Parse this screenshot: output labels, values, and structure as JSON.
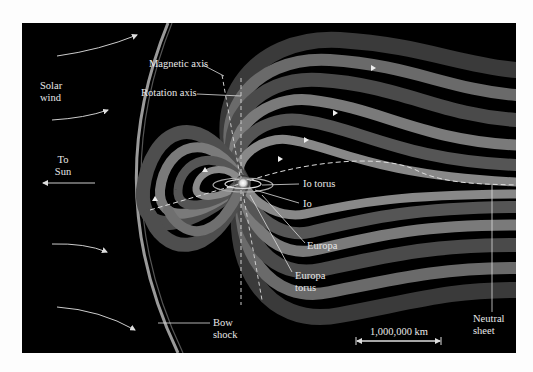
{
  "diagram": {
    "labels": {
      "solar_wind_1": "Solar",
      "solar_wind_2": "wind",
      "to_sun_1": "To",
      "to_sun_2": "Sun",
      "magnetic_axis": "Magnetic axis",
      "rotation_axis": "Rotation axis",
      "io_torus": "Io torus",
      "io": "Io",
      "europa": "Europa",
      "europa_torus_1": "Europa",
      "europa_torus_2": "torus",
      "bow_shock_1": "Bow",
      "bow_shock_2": "shock",
      "neutral_sheet_1": "Neutral",
      "neutral_sheet_2": "sheet",
      "scale": "1,000,000 km"
    },
    "colors": {
      "background": "#000000",
      "frame": "#fdfdfd",
      "field_lines": "#8a8a8a",
      "text": "#e8e8e8"
    }
  }
}
